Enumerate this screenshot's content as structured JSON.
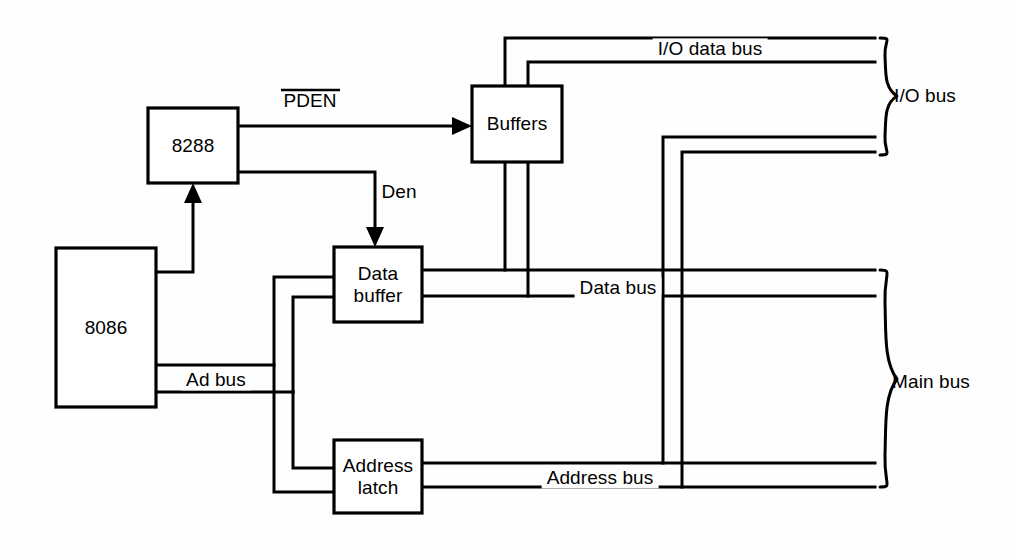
{
  "diagram": {
    "background_color": "#fefefe",
    "line_color": "#000000",
    "blocks": [
      {
        "id": "cpu",
        "label": "8086",
        "x": 56,
        "y": 248,
        "w": 100,
        "h": 159
      },
      {
        "id": "bus_controller",
        "label": "8288",
        "x": 148,
        "y": 108,
        "w": 90,
        "h": 75
      },
      {
        "id": "buffers",
        "label": "Buffers",
        "x": 472,
        "y": 86,
        "w": 90,
        "h": 76
      },
      {
        "id": "data_buffer",
        "label_line1": "Data",
        "label_line2": "buffer",
        "x": 334,
        "y": 247,
        "w": 88,
        "h": 75
      },
      {
        "id": "address_latch",
        "label_line1": "Address",
        "label_line2": "latch",
        "x": 334,
        "y": 440,
        "w": 88,
        "h": 73
      }
    ],
    "signal_labels": [
      {
        "id": "pden",
        "text": "PDEN",
        "overline": true,
        "x": 310,
        "y": 101
      },
      {
        "id": "den",
        "text": "Den",
        "overline": false,
        "x": 399,
        "y": 192
      }
    ],
    "bus_labels": [
      {
        "id": "io_data_bus",
        "text": "I/O data bus",
        "x": 710,
        "y": 49
      },
      {
        "id": "data_bus",
        "text": "Data bus",
        "x": 618,
        "y": 288
      },
      {
        "id": "ad_bus",
        "text": "Ad bus",
        "x": 216,
        "y": 380
      },
      {
        "id": "address_bus",
        "text": "Address bus",
        "x": 600,
        "y": 478
      }
    ],
    "group_labels": [
      {
        "id": "io_bus",
        "text": "I/O bus",
        "x": 925,
        "y": 96
      },
      {
        "id": "main_bus",
        "text": "Main bus",
        "x": 931,
        "y": 382
      }
    ]
  }
}
